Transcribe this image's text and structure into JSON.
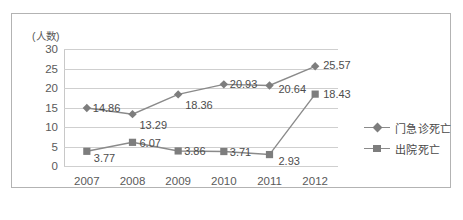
{
  "chart_data": {
    "type": "line",
    "title": "",
    "subtitle": "",
    "xlabel": "",
    "ylabel": "(人数)",
    "categories": [
      "2007",
      "2008",
      "2009",
      "2010",
      "2011",
      "2012"
    ],
    "series": [
      {
        "name": "门急诊死亡",
        "marker": "diamond",
        "color": "#7d7d7d",
        "values": [
          14.86,
          13.29,
          18.36,
          20.93,
          20.64,
          25.57
        ],
        "labels": [
          "14.86",
          "13.29",
          "18.36",
          "20.93",
          "20.64",
          "25.57"
        ]
      },
      {
        "name": "出院死亡",
        "marker": "square",
        "color": "#7d7d7d",
        "values": [
          3.77,
          6.07,
          3.86,
          3.71,
          2.93,
          18.43
        ],
        "labels": [
          "3.77",
          "6.07",
          "3.86",
          "3.71",
          "2.93",
          "18.43"
        ]
      }
    ],
    "ylim": [
      0,
      30
    ],
    "yticks": [
      0,
      5,
      10,
      15,
      20,
      25,
      30
    ],
    "ytick_labels": [
      "0",
      "5",
      "10",
      "15",
      "20",
      "25",
      "30"
    ],
    "grid": true,
    "legend_position": "right"
  },
  "colors": {
    "frame_border": "#b3b3b3",
    "gridline": "#cfcfcf",
    "series_line": "#8a8a8a",
    "marker": "#7d7d7d",
    "tick_text": "#5a5a5a",
    "label_text": "#4d4d4d",
    "background": "#ffffff"
  }
}
